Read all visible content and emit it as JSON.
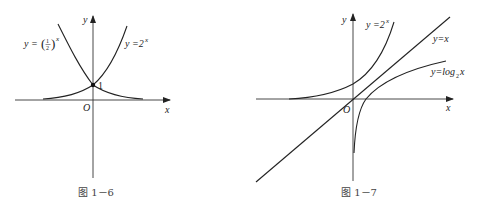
{
  "figures": [
    {
      "id": "fig-1-6",
      "caption": "图 1－6",
      "axes": {
        "x_label": "x",
        "y_label": "y",
        "origin_label": "O"
      },
      "curves": [
        {
          "name": "exp-half",
          "label_prefix": "y = (",
          "label_num": "1",
          "label_den": "2",
          "label_suffix": ")",
          "label_exp": "x",
          "function": "y=(1/2)^x"
        },
        {
          "name": "exp-two",
          "label_base": "y =2",
          "label_exp": "x",
          "function": "y=2^x"
        }
      ],
      "intersection": {
        "point": [
          0,
          1
        ],
        "label": "1"
      }
    },
    {
      "id": "fig-1-7",
      "caption": "图 1－7",
      "axes": {
        "x_label": "x",
        "y_label": "y",
        "origin_label": "O"
      },
      "curves": [
        {
          "name": "exp-two",
          "label_base": "y =2",
          "label_exp": "x",
          "function": "y=2^x"
        },
        {
          "name": "identity",
          "label": "y=x",
          "function": "y=x"
        },
        {
          "name": "log-two",
          "label_base": "y=log",
          "label_sub": "2",
          "label_arg": " x",
          "function": "y=log_2 x"
        }
      ]
    }
  ]
}
